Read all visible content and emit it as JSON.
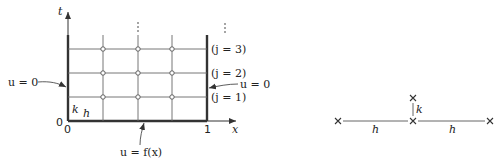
{
  "grid_diagram": {
    "axis_t_label": "t",
    "axis_x_label": "x",
    "origin_t": "0",
    "origin_x": "0",
    "x_end_tick": "1",
    "left_bc": "u = 0",
    "right_bc": "u = 0",
    "bottom_ic": "u = f(x)",
    "step_k": "k",
    "step_h": "h",
    "row_labels": [
      "(j = 3)",
      "(j = 2)",
      "(j = 1)"
    ],
    "continuation": "⋮"
  },
  "stencil": {
    "node_marker": "×",
    "vertical_step": "k",
    "left_step": "h",
    "right_step": "h"
  },
  "colors": {
    "line": "#555555",
    "boundary": "#333333",
    "text": "#222222",
    "background": "#ffffff"
  }
}
